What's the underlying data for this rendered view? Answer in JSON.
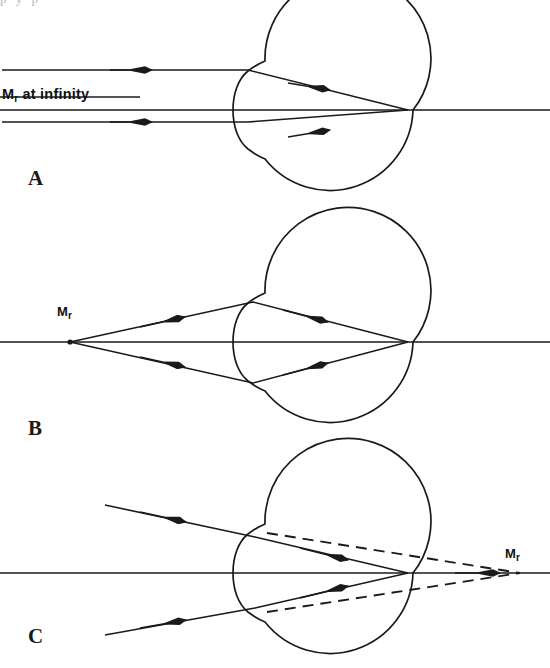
{
  "figure": {
    "background_color": "#ffffff",
    "ink_color": "#1a1a1a",
    "top_bleed_text": "p                         y    p",
    "panels": [
      {
        "letter": "A",
        "letter_x": 28,
        "letter_y": 170,
        "state": "parallel-rays-far-point-at-infinity",
        "label": {
          "text_main": "M",
          "text_sub": "r",
          "text_tail": " at infinity",
          "x": 2,
          "y": 86
        },
        "eye": {
          "cx": 330,
          "cy": 110,
          "r": 83
        },
        "axis": {
          "x1": 0,
          "y1": 110,
          "x2": 550,
          "y2": 110
        },
        "focal_point": {
          "x": 408,
          "y": 110
        },
        "rays": [
          {
            "kind": "solid",
            "points": "2,70 248,70 408,110",
            "arrow_at": 0.3
          },
          {
            "kind": "solid",
            "points": "2,122 248,122 408,110",
            "arrow_at": 0.3
          }
        ]
      },
      {
        "letter": "B",
        "letter_x": 28,
        "letter_y": 420,
        "state": "near-point-source-accommodated",
        "label": {
          "text_main": "M",
          "text_sub": "r",
          "text_tail": "",
          "x": 57,
          "y": 304
        },
        "eye": {
          "cx": 330,
          "cy": 342,
          "r": 83
        },
        "axis": {
          "x1": 0,
          "y1": 342,
          "x2": 550,
          "y2": 342
        },
        "source_point": {
          "x": 70,
          "y": 342
        },
        "focal_point": {
          "x": 408,
          "y": 342
        },
        "rays": [
          {
            "kind": "solid",
            "points": "70,342 253,302 408,342",
            "arrow_at": 0.33
          },
          {
            "kind": "solid",
            "points": "70,342 253,383 408,342",
            "arrow_at": 0.33
          }
        ]
      },
      {
        "letter": "C",
        "letter_x": 28,
        "letter_y": 628,
        "state": "converging-rays-virtual-far-point-behind-eye",
        "label": {
          "text_main": "M",
          "text_sub": "r",
          "text_tail": "",
          "x": 505,
          "y": 546
        },
        "eye": {
          "cx": 330,
          "cy": 573,
          "r": 83
        },
        "axis": {
          "x1": 0,
          "y1": 573,
          "x2": 550,
          "y2": 573
        },
        "virtual_point": {
          "x": 520,
          "y": 573
        },
        "focal_point": {
          "x": 408,
          "y": 573
        },
        "rays": [
          {
            "kind": "solid",
            "points": "105,505 255,537 408,573",
            "arrow_at": 0.36
          },
          {
            "kind": "solid",
            "points": "105,635 255,608 408,573",
            "arrow_at": 0.36
          }
        ],
        "dashed_rays": [
          {
            "kind": "dashed",
            "points": "267,533 520,573"
          },
          {
            "kind": "dashed",
            "points": "267,612 520,573"
          }
        ],
        "axis_arrow": {
          "x": 500,
          "y": 573
        }
      }
    ]
  }
}
